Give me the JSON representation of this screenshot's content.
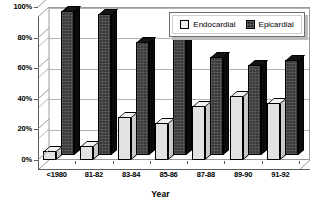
{
  "chart_data": {
    "type": "bar",
    "title": "",
    "xlabel": "Year",
    "ylabel": "",
    "ylim": [
      0,
      100
    ],
    "ytick_labels": [
      "0%",
      "20%",
      "40%",
      "60%",
      "80%",
      "100%"
    ],
    "ytick_values": [
      0,
      20,
      40,
      60,
      80,
      100
    ],
    "grid": true,
    "legend_position": "top-right",
    "style": "3d-clustered-column",
    "categories": [
      "<1980",
      "81-82",
      "83-84",
      "85-86",
      "87-88",
      "89-90",
      "91-92"
    ],
    "series": [
      {
        "name": "Endocardial",
        "color": "#e2e2e2",
        "values": [
          6,
          9,
          28,
          24,
          35,
          42,
          37
        ]
      },
      {
        "name": "Epicardial",
        "color": "#2e2e2e",
        "values": [
          94,
          92,
          74,
          78,
          64,
          59,
          62
        ]
      }
    ]
  },
  "legend": {
    "items": [
      {
        "label": "Endocardial",
        "swatch": "light-square-swatch"
      },
      {
        "label": "Epicardial",
        "swatch": "dark-square-swatch"
      }
    ]
  },
  "axis": {
    "x_title": "Year"
  }
}
